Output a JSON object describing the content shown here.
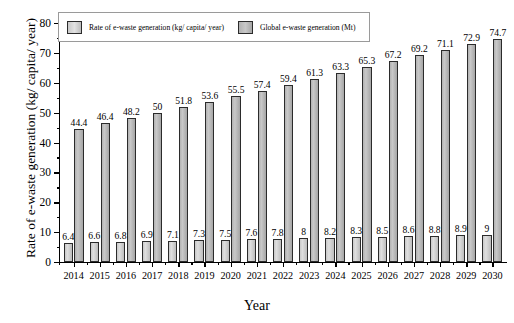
{
  "chart_data": {
    "type": "bar",
    "title": "",
    "xlabel": "Year",
    "ylabel": "Rate of e-waste generation (kg/ capita/ year)",
    "ylim": [
      0,
      80
    ],
    "ytick_step": 10,
    "grid": false,
    "legend_position": "top-left",
    "categories": [
      "2014",
      "2015",
      "2016",
      "2017",
      "2018",
      "2019",
      "2020",
      "2021",
      "2022",
      "2023",
      "2024",
      "2025",
      "2026",
      "2027",
      "2028",
      "2029",
      "2030"
    ],
    "yticks": [
      "0",
      "10",
      "20",
      "30",
      "40",
      "50",
      "60",
      "70",
      "80"
    ],
    "series": [
      {
        "name": "Rate of e-waste generation (kg/ capita/ year)",
        "color": "#d2d2d2",
        "values": [
          6.4,
          6.6,
          6.8,
          6.9,
          7.1,
          7.3,
          7.5,
          7.6,
          7.8,
          8,
          8.2,
          8.3,
          8.5,
          8.6,
          8.8,
          8.9,
          9
        ],
        "labels": [
          "6.4",
          "6.6",
          "6.8",
          "6.9",
          "7.1",
          "7.3",
          "7.5",
          "7.6",
          "7.8",
          "8",
          "8.2",
          "8.3",
          "8.5",
          "8.6",
          "8.8",
          "8.9",
          "9"
        ]
      },
      {
        "name": "Global e-waste generation (Mt)",
        "color": "#b8b8b8",
        "values": [
          44.4,
          46.4,
          48.2,
          50,
          51.8,
          53.6,
          55.5,
          57.4,
          59.4,
          61.3,
          63.3,
          65.3,
          67.2,
          69.2,
          71.1,
          72.9,
          74.7
        ],
        "labels": [
          "44.4",
          "46.4",
          "48.2",
          "50",
          "51.8",
          "53.6",
          "55.5",
          "57.4",
          "59.4",
          "61.3",
          "63.3",
          "65.3",
          "67.2",
          "69.2",
          "71.1",
          "72.9",
          "74.7"
        ]
      }
    ]
  },
  "axes": {
    "y_title": "Rate of e-waste generation (kg/ capita/ year)",
    "x_title": "Year"
  },
  "legend": {
    "items": [
      {
        "label": "Rate of e-waste generation (kg/ capita/ year)",
        "swatch": "rate"
      },
      {
        "label": "Global e-waste generation (Mt)",
        "swatch": "global"
      }
    ]
  }
}
